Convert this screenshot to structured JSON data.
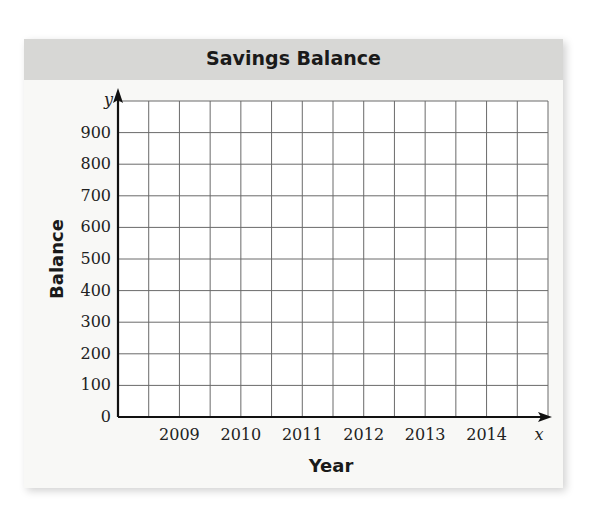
{
  "chart_data": {
    "type": "line",
    "title": "Savings Balance",
    "xlabel": "Year",
    "ylabel": "Balance",
    "x_axis_symbol": "x",
    "y_axis_symbol": "y",
    "x_ticks": [
      "2009",
      "2010",
      "2011",
      "2012",
      "2013",
      "2014"
    ],
    "y_ticks": [
      0,
      100,
      200,
      300,
      400,
      500,
      600,
      700,
      800,
      900
    ],
    "ylim": [
      0,
      1000
    ],
    "grid": true,
    "grid_columns": 14,
    "grid_rows": 10,
    "series": []
  }
}
